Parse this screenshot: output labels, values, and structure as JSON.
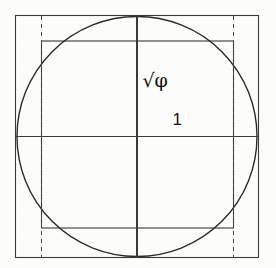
{
  "figure": {
    "background_color": "#fdfdfc",
    "stroke_color": "#2b2b2b",
    "label_color": "#111111"
  },
  "labels": {
    "sqrt_phi": "√φ",
    "unit": "1"
  },
  "chart_data": {
    "type": "diagram",
    "xlabel": "",
    "ylabel": "",
    "coordinate_space": {
      "width": 276,
      "height": 268,
      "units": "pixels"
    },
    "annotations": [
      {
        "text": "√φ",
        "x": 155,
        "y": 80,
        "meaning": "square-root-of-phi"
      },
      {
        "text": "1",
        "x": 177,
        "y": 119,
        "meaning": "unit-half-width"
      }
    ],
    "shapes": [
      {
        "name": "outer-square",
        "type": "rect",
        "x": 15.5,
        "y": 15.5,
        "width": 243,
        "height": 242,
        "stroke": "#3a3a3a",
        "stroke_width": 1.1,
        "dash": "none",
        "fill": "none"
      },
      {
        "name": "inscribed-circle",
        "type": "circle",
        "cx": 137,
        "cy": 136.5,
        "r": 120,
        "stroke": "#2b2b2b",
        "stroke_width": 1.4,
        "dash": "none",
        "fill": "none"
      },
      {
        "name": "inner-rectangle",
        "type": "rect",
        "x": 41.5,
        "y": 41,
        "width": 192,
        "height": 187,
        "stroke": "#3a3a3a",
        "stroke_width": 1.1,
        "dash": "none",
        "fill": "none"
      },
      {
        "name": "vertical-axis",
        "type": "line",
        "x1": 137,
        "y1": 15.5,
        "x2": 137,
        "y2": 257.5,
        "stroke": "#3a3a3a",
        "stroke_width": 1.1,
        "dash": "none"
      },
      {
        "name": "horizontal-axis",
        "type": "line",
        "x1": 15.5,
        "y1": 136.5,
        "x2": 258.5,
        "y2": 136.5,
        "stroke": "#3a3a3a",
        "stroke_width": 1.1,
        "dash": "none"
      },
      {
        "name": "left-dashed-guide",
        "type": "line",
        "x1": 41.5,
        "y1": 15.5,
        "x2": 41.5,
        "y2": 257.5,
        "stroke": "#4a4a4a",
        "stroke_width": 1.0,
        "dash": "4 4"
      },
      {
        "name": "right-dashed-guide",
        "type": "line",
        "x1": 233.5,
        "y1": 15.5,
        "x2": 233.5,
        "y2": 257.5,
        "stroke": "#4a4a4a",
        "stroke_width": 1.0,
        "dash": "4 4"
      }
    ]
  }
}
